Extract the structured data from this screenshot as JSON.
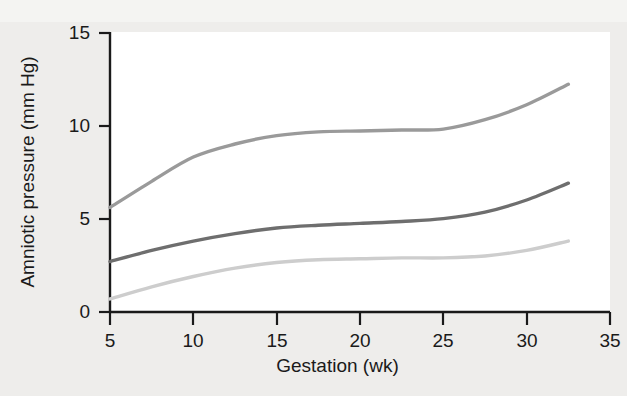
{
  "chart_data": {
    "type": "line",
    "title": "",
    "xlabel": "Gestation (wk)",
    "ylabel": "Amniotic pressure (mm Hg)",
    "xlim": [
      5,
      35
    ],
    "ylim": [
      0,
      15
    ],
    "xticks": [
      "5",
      "10",
      "15",
      "20",
      "25",
      "30",
      "35"
    ],
    "yticks": [
      "0",
      "5",
      "10",
      "15"
    ],
    "grid": false,
    "legend": "none",
    "x": [
      5,
      7.5,
      10,
      12.5,
      15,
      17.5,
      20,
      22.5,
      25,
      27.5,
      30,
      32.5
    ],
    "series": [
      {
        "name": "upper",
        "color": "#9a9a9a",
        "values": [
          5.6,
          7.0,
          8.3,
          9.0,
          9.45,
          9.65,
          9.7,
          9.75,
          9.8,
          10.3,
          11.1,
          12.2
        ]
      },
      {
        "name": "middle",
        "color": "#6e6e6e",
        "values": [
          2.7,
          3.3,
          3.8,
          4.2,
          4.5,
          4.65,
          4.75,
          4.85,
          5.0,
          5.35,
          6.0,
          6.9
        ]
      },
      {
        "name": "lower",
        "color": "#cdcdcd",
        "values": [
          0.7,
          1.35,
          1.9,
          2.35,
          2.65,
          2.8,
          2.85,
          2.9,
          2.9,
          3.0,
          3.3,
          3.8
        ]
      }
    ]
  },
  "axes": {
    "y_tick_labels": [
      "15",
      "10",
      "5",
      "0"
    ],
    "x_tick_labels": [
      "5",
      "10",
      "15",
      "20",
      "25",
      "30",
      "35"
    ],
    "y_axis_title": "Amniotic pressure (mm Hg)",
    "x_axis_title": "Gestation (wk)"
  },
  "colors": {
    "background": "#eeedeb",
    "plot_background": "#ffffff",
    "axis": "#1a1a1a",
    "series_upper": "#9a9a9a",
    "series_middle": "#6e6e6e",
    "series_lower": "#cdcdcd"
  }
}
